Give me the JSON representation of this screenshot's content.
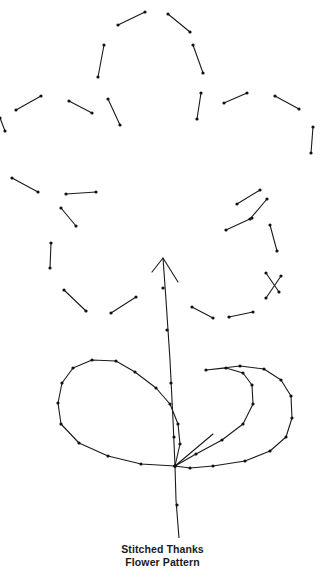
{
  "figure": {
    "background_color": "#ffffff",
    "stroke_color": "#1a1a1a",
    "dot_color": "#111111",
    "stroke_width": 1.1,
    "dot_radius": 1.6,
    "width": 325,
    "height": 572
  },
  "caption": {
    "line1": "Stitched Thanks",
    "line2": "Flower Pattern"
  },
  "chart_data": {
    "type": "diagram",
    "petal_stitches": [
      {
        "name": "top-petal-left-1",
        "x1": 118,
        "y1": 25,
        "x2": 145,
        "y2": 12
      },
      {
        "name": "top-petal-right-1",
        "x1": 168,
        "y1": 14,
        "x2": 190,
        "y2": 32
      },
      {
        "name": "top-petal-left-2",
        "x1": 193,
        "y1": 45,
        "x2": 203,
        "y2": 73
      },
      {
        "name": "top-petal-right-2",
        "x1": 104,
        "y1": 45,
        "x2": 98,
        "y2": 77
      },
      {
        "name": "upper-left-arc-1",
        "x1": 16,
        "y1": 110,
        "x2": 41,
        "y2": 96
      },
      {
        "name": "upper-left-arc-2",
        "x1": 69,
        "y1": 101,
        "x2": 92,
        "y2": 113
      },
      {
        "name": "upper-left-arc-3",
        "x1": 108,
        "y1": 99,
        "x2": 120,
        "y2": 125
      },
      {
        "name": "upper-left-edge",
        "x1": 0,
        "y1": 118,
        "x2": 5,
        "y2": 131
      },
      {
        "name": "upper-right-arc-1",
        "x1": 201,
        "y1": 93,
        "x2": 197,
        "y2": 119
      },
      {
        "name": "upper-right-arc-2",
        "x1": 224,
        "y1": 103,
        "x2": 247,
        "y2": 93
      },
      {
        "name": "upper-right-arc-3",
        "x1": 275,
        "y1": 96,
        "x2": 299,
        "y2": 109
      },
      {
        "name": "right-vertical",
        "x1": 313,
        "y1": 127,
        "x2": 311,
        "y2": 153
      },
      {
        "name": "mid-left-arc-1",
        "x1": 12,
        "y1": 178,
        "x2": 38,
        "y2": 192
      },
      {
        "name": "mid-left-arc-2",
        "x1": 66,
        "y1": 194,
        "x2": 96,
        "y2": 192
      },
      {
        "name": "mid-left-arc-3",
        "x1": 61,
        "y1": 208,
        "x2": 76,
        "y2": 226
      },
      {
        "name": "mid-left-vertical",
        "x1": 51,
        "y1": 243,
        "x2": 50,
        "y2": 268
      },
      {
        "name": "mid-right-arc-1",
        "x1": 237,
        "y1": 204,
        "x2": 260,
        "y2": 190
      },
      {
        "name": "mid-right-arc-2",
        "x1": 250,
        "y1": 219,
        "x2": 267,
        "y2": 199
      },
      {
        "name": "mid-right-arc-3",
        "x1": 226,
        "y1": 230,
        "x2": 252,
        "y2": 218
      },
      {
        "name": "lower-right-seg-1",
        "x1": 270,
        "y1": 225,
        "x2": 277,
        "y2": 251
      },
      {
        "name": "lower-right-seg-2",
        "x1": 266,
        "y1": 273,
        "x2": 279,
        "y2": 292
      },
      {
        "name": "bottom-left-arc-1",
        "x1": 64,
        "y1": 290,
        "x2": 86,
        "y2": 311
      },
      {
        "name": "bottom-left-arc-2",
        "x1": 111,
        "y1": 313,
        "x2": 136,
        "y2": 297
      },
      {
        "name": "bottom-right-arc-1",
        "x1": 192,
        "y1": 307,
        "x2": 213,
        "y2": 318
      },
      {
        "name": "bottom-right-arc-2",
        "x1": 229,
        "y1": 317,
        "x2": 253,
        "y2": 312
      },
      {
        "name": "bottom-right-arc-3",
        "x1": 266,
        "y1": 298,
        "x2": 281,
        "y2": 276
      }
    ],
    "stem": {
      "name": "stem-with-arrow",
      "points": [
        [
          163,
          258
        ],
        [
          166,
          300
        ],
        [
          170,
          360
        ],
        [
          173,
          420
        ],
        [
          175,
          466
        ],
        [
          176,
          500
        ],
        [
          179,
          538
        ]
      ],
      "arrow_tip": [
        163,
        258
      ],
      "arrow_left": [
        152,
        272
      ],
      "arrow_right": [
        178,
        282
      ],
      "dots": [
        [
          163,
          288
        ],
        [
          167,
          330
        ],
        [
          171,
          383
        ],
        [
          174,
          437
        ],
        [
          177,
          505
        ]
      ]
    },
    "extra_stroke": {
      "name": "short-diagonal",
      "x1": 213,
      "y1": 434,
      "x2": 175,
      "y2": 466
    },
    "left_leaf": {
      "name": "left-leaf-outline",
      "points": [
        [
          175,
          466
        ],
        [
          141,
          464
        ],
        [
          108,
          456
        ],
        [
          79,
          443
        ],
        [
          61,
          424
        ],
        [
          58,
          403
        ],
        [
          62,
          383
        ],
        [
          73,
          368
        ],
        [
          92,
          360
        ],
        [
          116,
          361
        ],
        [
          135,
          372
        ],
        [
          156,
          388
        ],
        [
          170,
          404
        ],
        [
          178,
          424
        ],
        [
          180,
          444
        ],
        [
          175,
          466
        ]
      ]
    },
    "right_leaf": {
      "name": "right-leaf-outline",
      "points": [
        [
          175,
          466
        ],
        [
          196,
          454
        ],
        [
          222,
          440
        ],
        [
          243,
          424
        ],
        [
          253,
          404
        ],
        [
          252,
          385
        ],
        [
          243,
          373
        ],
        [
          226,
          368
        ],
        [
          206,
          370
        ],
        [
          240,
          366
        ],
        [
          264,
          369
        ],
        [
          281,
          380
        ],
        [
          291,
          396
        ],
        [
          292,
          418
        ],
        [
          286,
          437
        ],
        [
          270,
          451
        ],
        [
          245,
          461
        ],
        [
          213,
          466
        ],
        [
          190,
          468
        ],
        [
          175,
          466
        ]
      ]
    }
  }
}
